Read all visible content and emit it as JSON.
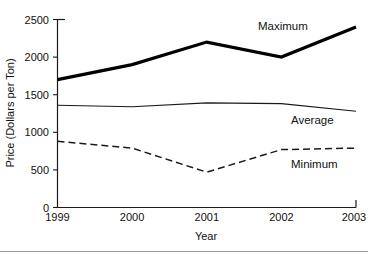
{
  "chart_data": {
    "type": "line",
    "title": "",
    "xlabel": "Year",
    "ylabel": "Price (Dollars per Ton)",
    "categories": [
      "1999",
      "2000",
      "2001",
      "2002",
      "2003"
    ],
    "x": [
      1999,
      2000,
      2001,
      2002,
      2003
    ],
    "xlim": [
      1999,
      2003
    ],
    "ylim": [
      0,
      2500
    ],
    "yticks": [
      0,
      500,
      1000,
      1500,
      2000,
      2500
    ],
    "ytick_labels": [
      "0",
      "500",
      "1000",
      "1500",
      "2000",
      "2500"
    ],
    "xtick_labels": [
      "1999",
      "2000",
      "2001",
      "2002",
      "2003"
    ],
    "grid": false,
    "legend": "inline-annotations",
    "series": [
      {
        "name": "Maximum",
        "values": [
          1700,
          1900,
          2200,
          2000,
          2400
        ],
        "style": "solid-thick",
        "color": "#000000",
        "label_x": 2001.25,
        "label_y": 2390
      },
      {
        "name": "Average",
        "values": [
          1360,
          1340,
          1390,
          1380,
          1280
        ],
        "style": "solid-thin",
        "color": "#1a1a1a",
        "label_x": 2002.25,
        "label_y": 1130
      },
      {
        "name": "Minimum",
        "values": [
          880,
          790,
          470,
          770,
          790
        ],
        "style": "dashed",
        "color": "#1a1a1a",
        "label_x": 2002.25,
        "label_y": 560
      }
    ],
    "annotations": [
      {
        "text": "Maximum",
        "series": "Maximum"
      },
      {
        "text": "Average",
        "series": "Average"
      },
      {
        "text": "Minimum",
        "series": "Minimum"
      }
    ]
  },
  "axes": {
    "y_title": "Price (Dollars per Ton)",
    "x_title": "Year"
  },
  "colors": {
    "ink": "#111111",
    "frame": "#1a1a1a",
    "background": "#ffffff",
    "rule": "#9a9a9a"
  }
}
